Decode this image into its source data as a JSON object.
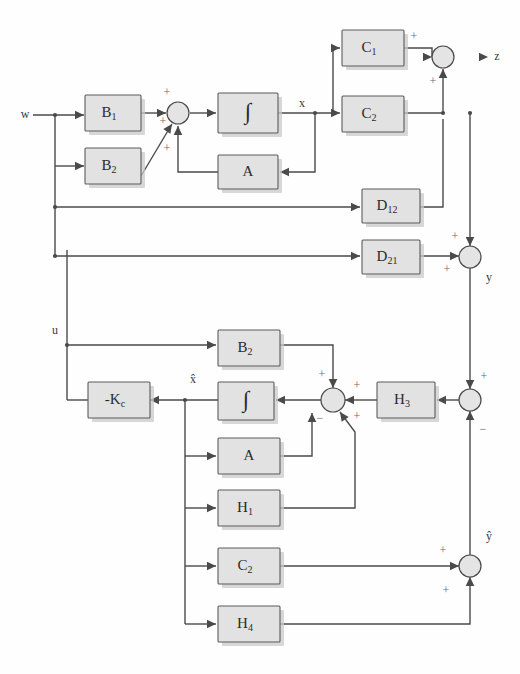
{
  "diagram": {
    "colors": {
      "block_fill": "#e2e2e2",
      "block_stroke": "#5b5b5b",
      "wire": "#4a4a4a",
      "background": "#ffffff",
      "sign_text": "#6a6a6a"
    },
    "blocks": [
      {
        "id": "B1",
        "label": "B",
        "sub": "1",
        "x": 85,
        "y": 95,
        "w": 56,
        "h": 36
      },
      {
        "id": "B2t",
        "label": "B",
        "sub": "2",
        "x": 85,
        "y": 148,
        "w": 56,
        "h": 36
      },
      {
        "id": "INT1",
        "label": "∫",
        "sub": "",
        "x": 218,
        "y": 93,
        "w": 60,
        "h": 40
      },
      {
        "id": "A1",
        "label": "A",
        "sub": "",
        "x": 218,
        "y": 155,
        "w": 60,
        "h": 34
      },
      {
        "id": "C1",
        "label": "C",
        "sub": "1",
        "x": 342,
        "y": 30,
        "w": 62,
        "h": 36
      },
      {
        "id": "C2t",
        "label": "C",
        "sub": "2",
        "x": 342,
        "y": 96,
        "w": 62,
        "h": 36
      },
      {
        "id": "D12",
        "label": "D",
        "sub": "12",
        "x": 362,
        "y": 189,
        "w": 58,
        "h": 34
      },
      {
        "id": "D21",
        "label": "D",
        "sub": "21",
        "x": 362,
        "y": 240,
        "w": 58,
        "h": 34
      },
      {
        "id": "B2b",
        "label": "B",
        "sub": "2",
        "x": 218,
        "y": 330,
        "w": 62,
        "h": 36
      },
      {
        "id": "KC",
        "label": "-K",
        "sub": "c",
        "x": 88,
        "y": 382,
        "w": 62,
        "h": 36
      },
      {
        "id": "INT2",
        "label": "∫",
        "sub": "",
        "x": 218,
        "y": 382,
        "w": 56,
        "h": 38
      },
      {
        "id": "H3",
        "label": "H",
        "sub": "3",
        "x": 377,
        "y": 382,
        "w": 58,
        "h": 36
      },
      {
        "id": "A2",
        "label": "A",
        "sub": "",
        "x": 218,
        "y": 438,
        "w": 62,
        "h": 36
      },
      {
        "id": "H1",
        "label": "H",
        "sub": "1",
        "x": 218,
        "y": 490,
        "w": 62,
        "h": 36
      },
      {
        "id": "C2b",
        "label": "C",
        "sub": "2",
        "x": 218,
        "y": 548,
        "w": 62,
        "h": 36
      },
      {
        "id": "H4",
        "label": "H",
        "sub": "4",
        "x": 218,
        "y": 606,
        "w": 62,
        "h": 36
      }
    ],
    "junctions": [
      {
        "id": "S1",
        "cx": 178,
        "cy": 113,
        "r": 11
      },
      {
        "id": "S2",
        "cx": 443,
        "cy": 57,
        "r": 11
      },
      {
        "id": "S3",
        "cx": 470,
        "cy": 257,
        "r": 11
      },
      {
        "id": "S4",
        "cx": 333,
        "cy": 400,
        "r": 12
      },
      {
        "id": "S5",
        "cx": 470,
        "cy": 400,
        "r": 11
      },
      {
        "id": "S6",
        "cx": 470,
        "cy": 566,
        "r": 11
      }
    ],
    "signals": [
      {
        "id": "w",
        "text": "w",
        "x": 25,
        "y": 115
      },
      {
        "id": "x",
        "text": "x",
        "x": 302,
        "y": 104
      },
      {
        "id": "z",
        "text": "z",
        "x": 497,
        "y": 57
      },
      {
        "id": "y",
        "text": "y",
        "x": 489,
        "y": 278
      },
      {
        "id": "u",
        "text": "u",
        "x": 55,
        "y": 331
      },
      {
        "id": "xhat",
        "text": "x̂",
        "x": 193,
        "y": 380
      },
      {
        "id": "yhat",
        "text": "ŷ",
        "x": 489,
        "y": 537
      }
    ],
    "sign_marks": [
      {
        "id": "s1-top",
        "text": "+",
        "x": 167,
        "y": 93
      },
      {
        "id": "s1-left",
        "text": "+",
        "x": 163,
        "y": 122
      },
      {
        "id": "s1-bot",
        "text": "+",
        "x": 167,
        "y": 149
      },
      {
        "id": "s2-top",
        "text": "+",
        "x": 414,
        "y": 37
      },
      {
        "id": "s2-bot",
        "text": "+",
        "x": 433,
        "y": 82
      },
      {
        "id": "s3-top",
        "text": "+",
        "x": 455,
        "y": 237
      },
      {
        "id": "s3-bot",
        "text": "+",
        "x": 447,
        "y": 270
      },
      {
        "id": "s4-top",
        "text": "+",
        "x": 322,
        "y": 375
      },
      {
        "id": "s4-right",
        "text": "+",
        "x": 357,
        "y": 386
      },
      {
        "id": "s4-bl",
        "text": "−",
        "x": 320,
        "y": 419
      },
      {
        "id": "s4-br",
        "text": "+",
        "x": 357,
        "y": 417
      },
      {
        "id": "s5-top",
        "text": "+",
        "x": 484,
        "y": 377
      },
      {
        "id": "s5-bot",
        "text": "−",
        "x": 483,
        "y": 430
      },
      {
        "id": "s6-left",
        "text": "+",
        "x": 443,
        "y": 551
      },
      {
        "id": "s6-bot",
        "text": "+",
        "x": 446,
        "y": 591
      }
    ],
    "wires": [
      {
        "id": "w-in",
        "d": "M 33 115 L 84 115"
      },
      {
        "id": "w-tap-down",
        "d": "M 55 115 L 55 256"
      },
      {
        "id": "w-to-b2",
        "d": "M 55 166 L 84 166"
      },
      {
        "id": "b1-out",
        "d": "M 141 113 L 166 113"
      },
      {
        "id": "b2-out-diag",
        "d": "M 141 176 L 172 124"
      },
      {
        "id": "sum1-out",
        "d": "M 190 113 L 216 113"
      },
      {
        "id": "int1-out",
        "d": "M 278 113 L 333 113"
      },
      {
        "id": "x-up-c1",
        "d": "M 333 113 L 333 48 L 340 48"
      },
      {
        "id": "x-to-c2",
        "d": "M 333 113 L 340 113"
      },
      {
        "id": "x-down-a",
        "d": "M 315 113 L 315 172 L 280 172"
      },
      {
        "id": "a1-out",
        "d": "M 218 172 L 178 172 L 178 126"
      },
      {
        "id": "c1-out",
        "d": "M 404 48 L 432 48 L 432 57"
      },
      {
        "id": "c2-out",
        "d": "M 404 113 L 443 113"
      },
      {
        "id": "c2-up-sum2",
        "d": "M 443 113 L 443 69"
      },
      {
        "id": "d12-in",
        "d": "M 55 207 L 360 207"
      },
      {
        "id": "d12-out",
        "d": "M 420 207 L 443 207 L 443 119"
      },
      {
        "id": "d21-in",
        "d": "M 55 256 L 360 256"
      },
      {
        "id": "d21-out",
        "d": "M 420 256 L 459 256"
      },
      {
        "id": "c2-to-y",
        "d": "M 470 113 L 470 246"
      },
      {
        "id": "y-down",
        "d": "M 470 268 L 470 389"
      },
      {
        "id": "u-line",
        "d": "M 67 400 L 67 345 L 216 345"
      },
      {
        "id": "u-up",
        "d": "M 67 345 L 67 250"
      },
      {
        "id": "b2b-out",
        "d": "M 280 345 L 333 345 L 333 388"
      },
      {
        "id": "h3-out",
        "d": "M 377 400 L 345 400"
      },
      {
        "id": "sum5-to-h3",
        "d": "M 459 400 L 437 400"
      },
      {
        "id": "sum4-to-int2",
        "d": "M 321 400 L 276 400"
      },
      {
        "id": "int2-out",
        "d": "M 218 400 L 150 400"
      },
      {
        "id": "kc-out",
        "d": "M 88 400 L 67 400"
      },
      {
        "id": "xhat-branch",
        "d": "M 185 400 L 185 624"
      },
      {
        "id": "xhat-to-a2",
        "d": "M 185 456 L 216 456"
      },
      {
        "id": "xhat-to-h1",
        "d": "M 185 508 L 216 508"
      },
      {
        "id": "xhat-to-c2b",
        "d": "M 185 566 L 216 566"
      },
      {
        "id": "xhat-to-h4",
        "d": "M 185 624 L 216 624"
      },
      {
        "id": "a2-out",
        "d": "M 280 456 L 312 456 L 312 413"
      },
      {
        "id": "h1-out",
        "d": "M 280 508 L 355 508 L 355 432 L 340 412"
      },
      {
        "id": "c2b-out",
        "d": "M 280 566 L 459 566"
      },
      {
        "id": "h4-out",
        "d": "M 280 624 L 470 624 L 470 577"
      },
      {
        "id": "yhat-up",
        "d": "M 470 555 L 470 411"
      }
    ],
    "arrows": [
      {
        "id": "ar-b1-in",
        "x": 84,
        "y": 115,
        "dir": "right"
      },
      {
        "id": "ar-b2-in",
        "x": 84,
        "y": 166,
        "dir": "right"
      },
      {
        "id": "ar-sum1-l",
        "x": 166,
        "y": 113,
        "dir": "right"
      },
      {
        "id": "ar-sum1-dg",
        "x": 172,
        "y": 124,
        "dir": "upright"
      },
      {
        "id": "ar-sum1-b",
        "x": 178,
        "y": 126,
        "dir": "up"
      },
      {
        "id": "ar-int1",
        "x": 216,
        "y": 113,
        "dir": "right"
      },
      {
        "id": "ar-c1-in",
        "x": 340,
        "y": 48,
        "dir": "right"
      },
      {
        "id": "ar-c2-in",
        "x": 340,
        "y": 113,
        "dir": "right"
      },
      {
        "id": "ar-a1-in",
        "x": 280,
        "y": 172,
        "dir": "left"
      },
      {
        "id": "ar-sum2-l",
        "x": 432,
        "y": 57,
        "dir": "right"
      },
      {
        "id": "ar-sum2-b",
        "x": 443,
        "y": 69,
        "dir": "up"
      },
      {
        "id": "ar-z",
        "x": 488,
        "y": 57,
        "dir": "right"
      },
      {
        "id": "ar-d12-in",
        "x": 360,
        "y": 207,
        "dir": "right"
      },
      {
        "id": "ar-d21-in",
        "x": 360,
        "y": 256,
        "dir": "right"
      },
      {
        "id": "ar-sum3-l",
        "x": 459,
        "y": 256,
        "dir": "right"
      },
      {
        "id": "ar-sum3-t",
        "x": 470,
        "y": 246,
        "dir": "down"
      },
      {
        "id": "ar-b2b-in",
        "x": 216,
        "y": 345,
        "dir": "right"
      },
      {
        "id": "ar-sum4-t",
        "x": 333,
        "y": 388,
        "dir": "down"
      },
      {
        "id": "ar-sum4-r",
        "x": 345,
        "y": 400,
        "dir": "left"
      },
      {
        "id": "ar-sum4-bl",
        "x": 312,
        "y": 413,
        "dir": "up"
      },
      {
        "id": "ar-sum4-br",
        "x": 340,
        "y": 412,
        "dir": "upleft"
      },
      {
        "id": "ar-int2-in",
        "x": 276,
        "y": 400,
        "dir": "left"
      },
      {
        "id": "ar-kc-in",
        "x": 150,
        "y": 400,
        "dir": "left"
      },
      {
        "id": "ar-h3-in",
        "x": 437,
        "y": 400,
        "dir": "left"
      },
      {
        "id": "ar-sum5-t",
        "x": 470,
        "y": 389,
        "dir": "down"
      },
      {
        "id": "ar-sum5-b",
        "x": 470,
        "y": 411,
        "dir": "up"
      },
      {
        "id": "ar-a2-in",
        "x": 216,
        "y": 456,
        "dir": "right"
      },
      {
        "id": "ar-h1-in",
        "x": 216,
        "y": 508,
        "dir": "right"
      },
      {
        "id": "ar-c2b-in",
        "x": 216,
        "y": 566,
        "dir": "right"
      },
      {
        "id": "ar-h4-in",
        "x": 216,
        "y": 624,
        "dir": "right"
      },
      {
        "id": "ar-sum6-l",
        "x": 459,
        "y": 566,
        "dir": "right"
      },
      {
        "id": "ar-sum6-b",
        "x": 470,
        "y": 577,
        "dir": "up"
      }
    ],
    "dots": [
      {
        "id": "dot-w-tap",
        "cx": 55,
        "cy": 115
      },
      {
        "id": "dot-w-207",
        "cx": 55,
        "cy": 207
      },
      {
        "id": "dot-w-256",
        "cx": 55,
        "cy": 256
      },
      {
        "id": "dot-u-345",
        "cx": 67,
        "cy": 345
      },
      {
        "id": "dot-x",
        "cx": 333,
        "cy": 113
      },
      {
        "id": "dot-x-a",
        "cx": 315,
        "cy": 113
      },
      {
        "id": "dot-c2out",
        "cx": 443,
        "cy": 113
      },
      {
        "id": "dot-c2out2",
        "cx": 470,
        "cy": 113
      },
      {
        "id": "dot-xhat",
        "cx": 185,
        "cy": 400
      }
    ]
  }
}
